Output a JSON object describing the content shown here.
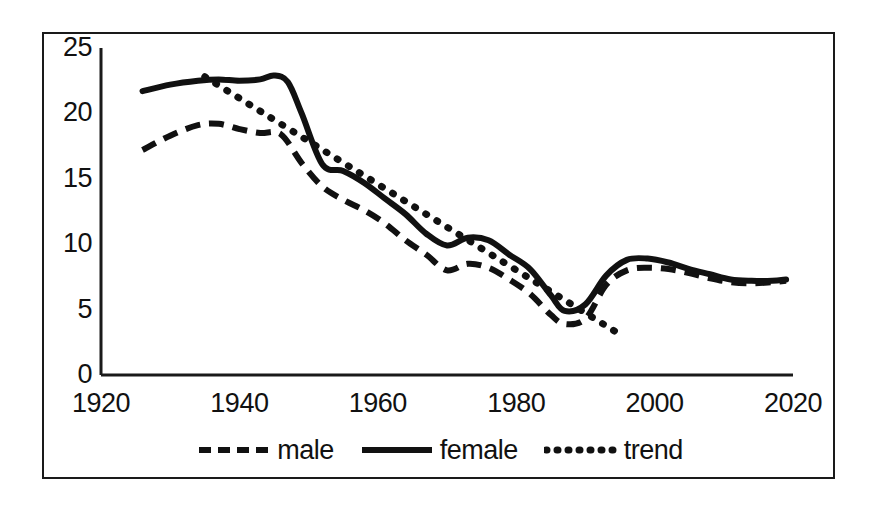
{
  "chart_data": {
    "type": "line",
    "title": "",
    "xlabel": "",
    "ylabel": "",
    "xlim": [
      1920,
      2020
    ],
    "ylim": [
      0,
      25
    ],
    "grid": false,
    "legend_position": "bottom",
    "xticks": [
      "1920",
      "1940",
      "1960",
      "1980",
      "2000",
      "2020"
    ],
    "yticks": [
      "0",
      "5",
      "10",
      "15",
      "20",
      "25"
    ],
    "series": [
      {
        "name": "male",
        "style": "dashed",
        "color": "#111111",
        "x": [
          1926,
          1930,
          1934,
          1937,
          1940,
          1943,
          1946,
          1949,
          1952,
          1955,
          1958,
          1961,
          1964,
          1967,
          1970,
          1973,
          1976,
          1979,
          1982,
          1985,
          1987,
          1990,
          1993,
          1996,
          1999,
          2002,
          2005,
          2008,
          2011,
          2014,
          2017,
          2019
        ],
        "values": [
          17.2,
          18.3,
          19.1,
          19.2,
          18.8,
          18.5,
          18.4,
          16.2,
          14.4,
          13.4,
          12.6,
          11.6,
          10.3,
          9.2,
          8.0,
          8.5,
          8.2,
          7.3,
          6.2,
          4.6,
          3.9,
          4.3,
          6.9,
          8.0,
          8.2,
          8.1,
          7.8,
          7.4,
          7.1,
          7.0,
          7.1,
          7.2
        ]
      },
      {
        "name": "female",
        "style": "solid",
        "color": "#111111",
        "x": [
          1926,
          1930,
          1934,
          1937,
          1940,
          1943,
          1945,
          1947,
          1949,
          1952,
          1955,
          1958,
          1961,
          1964,
          1967,
          1970,
          1973,
          1976,
          1979,
          1982,
          1985,
          1987,
          1990,
          1993,
          1996,
          1999,
          2002,
          2005,
          2008,
          2011,
          2014,
          2017,
          2019
        ],
        "values": [
          21.7,
          22.2,
          22.5,
          22.6,
          22.5,
          22.6,
          22.9,
          22.4,
          20.0,
          16.1,
          15.6,
          14.7,
          13.5,
          12.3,
          10.8,
          9.9,
          10.5,
          10.3,
          9.2,
          8.1,
          6.1,
          4.9,
          5.4,
          7.6,
          8.8,
          8.9,
          8.6,
          8.1,
          7.7,
          7.3,
          7.2,
          7.2,
          7.3
        ]
      },
      {
        "name": "trend",
        "style": "dotted",
        "color": "#111111",
        "x": [
          1935,
          1995
        ],
        "values": [
          22.8,
          3.1
        ]
      }
    ]
  },
  "legend": {
    "items": [
      {
        "label": "male",
        "style": "dashed"
      },
      {
        "label": "female",
        "style": "solid"
      },
      {
        "label": "trend",
        "style": "dotted"
      }
    ]
  }
}
